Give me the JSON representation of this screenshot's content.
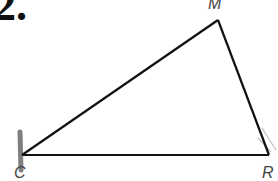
{
  "problem": {
    "number": "2."
  },
  "diagram": {
    "type": "triangle",
    "vertices": [
      {
        "label": "M",
        "x": 218,
        "y": 20
      },
      {
        "label": "C",
        "x": 22,
        "y": 155
      },
      {
        "label": "R",
        "x": 269,
        "y": 155
      }
    ],
    "labels": {
      "M": "M",
      "C": "C",
      "R": "R"
    },
    "stroke_color": "#111111"
  }
}
